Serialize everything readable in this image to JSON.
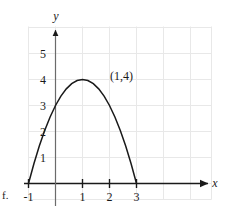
{
  "figure": {
    "part_label": "f.",
    "axis_x_name": "x",
    "axis_y_name": "y",
    "annotation": "(1,4)",
    "grid_color": "#e8e8e8",
    "axis_color": "#1a1a1a",
    "curve_color": "#1a1a1a"
  },
  "chart_data": {
    "type": "line",
    "title": "",
    "xlabel": "x",
    "ylabel": "y",
    "xlim": [
      -2,
      6
    ],
    "ylim": [
      -1,
      6.5
    ],
    "grid": true,
    "legend": null,
    "x_ticks": [
      -1,
      1,
      2,
      3
    ],
    "x_tick_labels": [
      "-1",
      "1",
      "2",
      "3"
    ],
    "y_ticks": [
      1,
      2,
      3,
      4,
      5
    ],
    "y_tick_labels": [
      "1",
      "2",
      "3",
      "4",
      "5"
    ],
    "series": [
      {
        "name": "parabola",
        "equation": "y = -(x-1)^2 + 4",
        "vertex": [
          1,
          4
        ],
        "roots": [
          -1,
          3
        ],
        "y_intercept": 3,
        "x": [
          -1,
          -0.8,
          -0.6,
          -0.4,
          -0.2,
          0,
          0.2,
          0.4,
          0.6,
          0.8,
          1,
          1.2,
          1.4,
          1.6,
          1.8,
          2,
          2.2,
          2.4,
          2.6,
          2.8,
          3
        ],
        "values": [
          0,
          0.76,
          1.44,
          2.04,
          2.56,
          3,
          3.36,
          3.64,
          3.84,
          3.96,
          4,
          3.96,
          3.84,
          3.64,
          3.36,
          3,
          2.56,
          2.04,
          1.44,
          0.76,
          0
        ]
      }
    ],
    "annotations": [
      {
        "text": "(1,4)",
        "x": 2.05,
        "y": 4.35
      }
    ]
  }
}
